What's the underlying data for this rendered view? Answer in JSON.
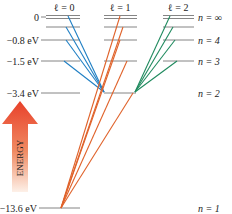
{
  "diagram": {
    "columns": [
      {
        "label": "ℓ = 0",
        "color": "#1f7fc4"
      },
      {
        "label": "ℓ = 1",
        "color": "#e0622a"
      },
      {
        "label": "ℓ = 2",
        "color": "#1f8a5e"
      }
    ],
    "energy_labels": [
      {
        "text": "0",
        "y": 17
      },
      {
        "text": "−0.8 eV",
        "y": 40
      },
      {
        "text": "−1.5 eV",
        "y": 61
      },
      {
        "text": "−3.4 eV",
        "y": 93
      },
      {
        "text": "−13.6 eV",
        "y": 208
      }
    ],
    "n_labels": [
      {
        "text": "n = ∞",
        "y": 17
      },
      {
        "text": "n = 4",
        "y": 40
      },
      {
        "text": "n = 3",
        "y": 61
      },
      {
        "text": "n = 2",
        "y": 93
      },
      {
        "text": "n = 1",
        "y": 208
      }
    ],
    "axis_label": "ENERGY",
    "arrow_color_top": "#e8412a",
    "arrow_color_bottom": "#fbe3d6"
  }
}
